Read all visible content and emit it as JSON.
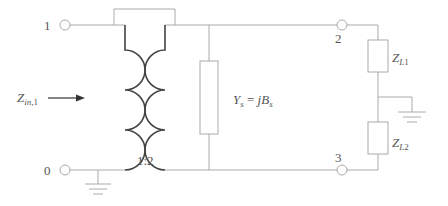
{
  "diagram": {
    "type": "circuit",
    "terminals": [
      {
        "id": "1",
        "label": "1"
      },
      {
        "id": "0",
        "label": "0"
      },
      {
        "id": "2",
        "label": "2"
      },
      {
        "id": "3",
        "label": "3"
      }
    ],
    "transformer": {
      "ratio_label": "1:2"
    },
    "shunt_admittance": {
      "symbol": "Y",
      "sub": "s",
      "eq": " = ",
      "rhs": "jB",
      "rhs_sub": "s"
    },
    "loads": [
      {
        "symbol": "Z",
        "sub": "L",
        "index": "1"
      },
      {
        "symbol": "Z",
        "sub": "L",
        "index": "2"
      }
    ],
    "input_impedance": {
      "symbol": "Z",
      "sub": "in",
      "index": ",1",
      "arrow": "→"
    },
    "colors": {
      "wire": "#aaaaaa",
      "coil": "#444444",
      "text": "#555555"
    }
  }
}
